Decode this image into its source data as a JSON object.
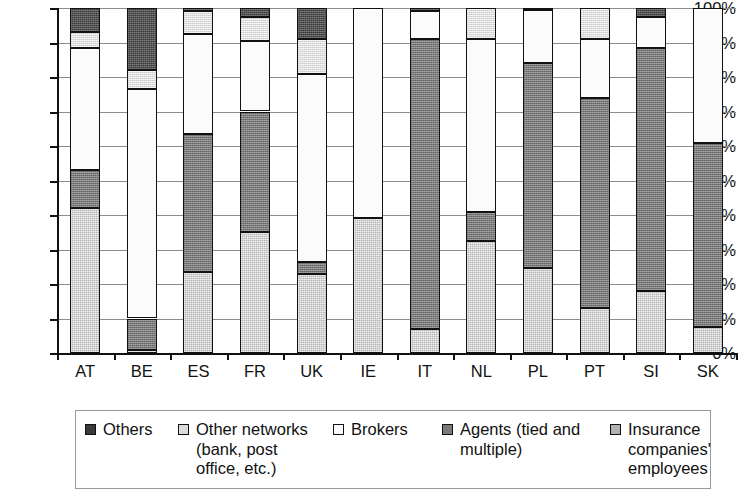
{
  "chart_data": {
    "type": "bar",
    "stacked": true,
    "title": "",
    "subtitle": "",
    "xlabel": "",
    "ylabel": "",
    "ylim": [
      0,
      100
    ],
    "grid": true,
    "legend_position": "bottom",
    "y_tick_labels": [
      "100%",
      "90%",
      "80%",
      "70%",
      "60%",
      "50%",
      "40%",
      "30%",
      "20%",
      "10%",
      "0%"
    ],
    "y_tick_values": [
      100,
      90,
      80,
      70,
      60,
      50,
      40,
      30,
      20,
      10,
      0
    ],
    "categories": [
      "AT",
      "BE",
      "ES",
      "FR",
      "UK",
      "IE",
      "IT",
      "NL",
      "PL",
      "PT",
      "SI",
      "SK"
    ],
    "series": [
      {
        "name": "Insurance companies' employees",
        "key": "employees",
        "swatch": "#b2b2b2",
        "values": [
          42,
          1,
          23.5,
          35,
          23,
          39,
          7,
          32.5,
          24.5,
          13,
          18,
          7.5
        ]
      },
      {
        "name": "Agents (tied and multiple)",
        "key": "agents",
        "swatch": "#7a7a7a",
        "values": [
          11,
          9,
          40,
          35,
          3.5,
          0,
          84,
          8.5,
          59.5,
          61,
          70.5,
          53.5
        ]
      },
      {
        "name": "Brokers",
        "key": "brokers",
        "swatch": "#fbfbfb",
        "values": [
          35.5,
          66.5,
          29,
          20.5,
          54.5,
          61,
          8,
          50,
          15.5,
          17,
          9,
          39
        ]
      },
      {
        "name": "Other networks (bank, post office, etc.)",
        "key": "other_networks",
        "swatch": "#dcdcdc",
        "values": [
          4.5,
          5.5,
          6.5,
          7,
          10,
          0,
          0,
          9,
          0,
          9,
          0,
          0
        ]
      },
      {
        "name": "Others",
        "key": "others",
        "swatch": "#3a3a3a",
        "values": [
          7,
          18,
          1,
          2.5,
          9,
          0,
          1,
          0,
          0.5,
          0,
          2.5,
          0
        ]
      }
    ]
  },
  "legend": {
    "items": [
      {
        "label": "Others",
        "swatch": "#3a3a3a"
      },
      {
        "label": "Other networks (bank, post office, etc.)",
        "swatch": "#dcdcdc"
      },
      {
        "label": "Brokers",
        "swatch": "#fbfbfb"
      },
      {
        "label": "Agents (tied and multiple)",
        "swatch": "#7a7a7a"
      },
      {
        "label": "Insurance companies' employees",
        "swatch": "#b2b2b2"
      }
    ]
  },
  "colors": {
    "axis": "#111111",
    "gridline": "#8d8d8d",
    "background": "#ffffff",
    "legend_border": "#9a9a9a"
  }
}
